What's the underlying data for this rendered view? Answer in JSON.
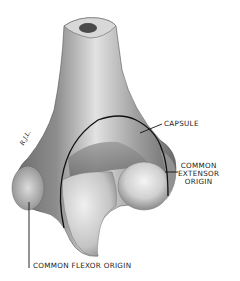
{
  "figure": {
    "artist_signature": "R.J.L.",
    "colors": {
      "background": "#ffffff",
      "bone_light": "#e8e8e8",
      "bone_mid": "#a6a6a6",
      "bone_dark": "#4a4a4a",
      "outline": "#1a1a1a"
    }
  },
  "labels": {
    "capsule": "CAPSULE",
    "common_extensor_origin": [
      "COMMON",
      "EXTENSOR",
      "ORIGIN"
    ],
    "common_flexor_origin": "COMMON FLEXOR ORIGIN"
  }
}
